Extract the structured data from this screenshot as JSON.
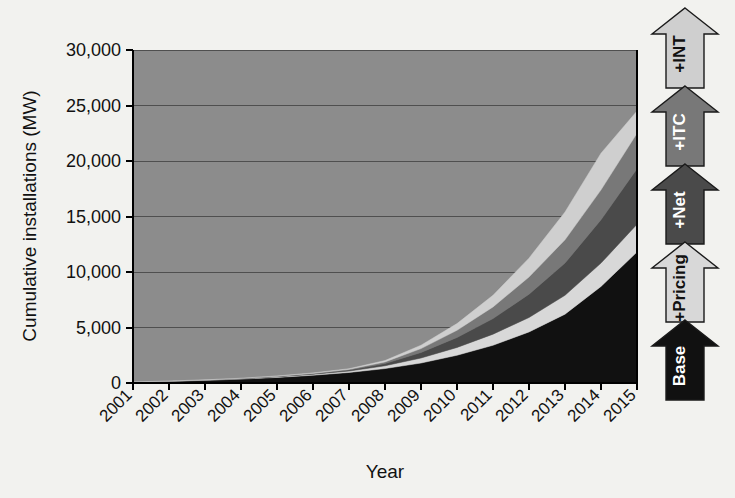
{
  "chart_data": {
    "type": "area",
    "title": "",
    "subtitle": "",
    "xlabel": "Year",
    "ylabel": "Cumulative installations (MW)",
    "stacked": true,
    "grid": true,
    "legend_position": "right",
    "categories": [
      "2001",
      "2002",
      "2003",
      "2004",
      "2005",
      "2006",
      "2007",
      "2008",
      "2009",
      "2010",
      "2011",
      "2012",
      "2013",
      "2014",
      "2015"
    ],
    "x": [
      2001,
      2002,
      2003,
      2004,
      2005,
      2006,
      2007,
      2008,
      2009,
      2010,
      2011,
      2012,
      2013,
      2014,
      2015
    ],
    "xlim": [
      2001,
      2015
    ],
    "ylim": [
      0,
      30000
    ],
    "yticks": [
      0,
      5000,
      10000,
      15000,
      20000,
      25000,
      30000
    ],
    "ytick_labels": [
      "0",
      "5,000",
      "10,000",
      "15,000",
      "20,000",
      "25,000",
      "30,000"
    ],
    "series": [
      {
        "name": "Base",
        "color": "#111111",
        "values": [
          100,
          160,
          240,
          350,
          500,
          700,
          950,
          1300,
          1800,
          2500,
          3400,
          4600,
          6200,
          8700,
          11800
        ]
      },
      {
        "name": "+Pricing",
        "color": "#d8d8d8",
        "values": [
          0,
          10,
          20,
          35,
          55,
          80,
          120,
          250,
          450,
          700,
          1000,
          1300,
          1700,
          2100,
          2500
        ]
      },
      {
        "name": "+Net",
        "color": "#4a4a4a",
        "values": [
          0,
          5,
          12,
          20,
          35,
          55,
          90,
          200,
          500,
          900,
          1400,
          2100,
          2900,
          3900,
          5000
        ]
      },
      {
        "name": "+ITC",
        "color": "#787878",
        "values": [
          0,
          3,
          8,
          14,
          25,
          40,
          70,
          150,
          350,
          650,
          1050,
          1550,
          2100,
          2700,
          3200
        ]
      },
      {
        "name": "+INT",
        "color": "#cfcfcf",
        "values": [
          0,
          2,
          5,
          10,
          18,
          30,
          55,
          120,
          300,
          600,
          1050,
          1700,
          2500,
          3300,
          2000
        ]
      }
    ],
    "cumulative_totals_2015": 24500,
    "annotations": []
  },
  "axes": {
    "y_title": "Cumulative installations (MW)",
    "x_title": "Year",
    "y_tick_labels": [
      "30,000",
      "25,000",
      "20,000",
      "15,000",
      "10,000",
      "5,000",
      "0"
    ],
    "x_tick_labels": [
      "2001",
      "2002",
      "2003",
      "2004",
      "2005",
      "2006",
      "2007",
      "2008",
      "2009",
      "2010",
      "2011",
      "2012",
      "2013",
      "2014",
      "2015"
    ]
  },
  "legend": {
    "orientation": "vertical-stacked-arrows",
    "items": [
      {
        "label": "+INT",
        "fill": "#cfcfcf",
        "text_color": "#111111",
        "order": 5
      },
      {
        "label": "+ITC",
        "fill": "#787878",
        "text_color": "#ffffff",
        "order": 4
      },
      {
        "label": "+Net",
        "fill": "#4a4a4a",
        "text_color": "#ffffff",
        "order": 3
      },
      {
        "label": "+Pricing",
        "fill": "#d8d8d8",
        "text_color": "#111111",
        "order": 2
      },
      {
        "label": "Base",
        "fill": "#111111",
        "text_color": "#ffffff",
        "order": 1
      }
    ]
  },
  "colors": {
    "background": "#f2f2ef",
    "plot_fill": "#8c8c8c",
    "axis": "#000000",
    "gridline": "#555555",
    "text": "#111111"
  }
}
